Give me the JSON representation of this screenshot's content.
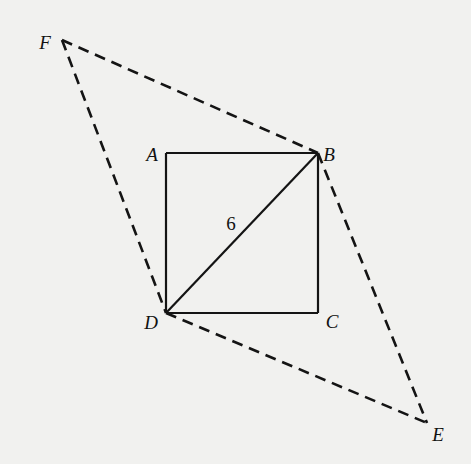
{
  "diagram": {
    "background_color": "#f1f1ef",
    "stroke_color": "#141414",
    "points": {
      "A": {
        "label": "A",
        "x": 166,
        "y": 153,
        "label_x": 152,
        "label_y": 154
      },
      "B": {
        "label": "B",
        "x": 318,
        "y": 153,
        "label_x": 329,
        "label_y": 154
      },
      "C": {
        "label": "C",
        "x": 318,
        "y": 313,
        "label_x": 332,
        "label_y": 321
      },
      "D": {
        "label": "D",
        "x": 166,
        "y": 313,
        "label_x": 151,
        "label_y": 322
      },
      "E": {
        "label": "E",
        "x": 427,
        "y": 423,
        "label_x": 438,
        "label_y": 434
      },
      "F": {
        "label": "F",
        "x": 62,
        "y": 40,
        "label_x": 45,
        "label_y": 42
      }
    },
    "segments": [
      {
        "from": "A",
        "to": "B",
        "style": "solid"
      },
      {
        "from": "B",
        "to": "C",
        "style": "solid"
      },
      {
        "from": "C",
        "to": "D",
        "style": "solid"
      },
      {
        "from": "D",
        "to": "A",
        "style": "solid"
      },
      {
        "from": "D",
        "to": "B",
        "style": "solid"
      },
      {
        "from": "F",
        "to": "B",
        "style": "dashed"
      },
      {
        "from": "F",
        "to": "D",
        "style": "dashed"
      },
      {
        "from": "B",
        "to": "E",
        "style": "dashed"
      },
      {
        "from": "D",
        "to": "E",
        "style": "dashed"
      }
    ],
    "measure_labels": [
      {
        "text": "6",
        "on_segment": "DB",
        "x": 231,
        "y": 223
      }
    ]
  }
}
